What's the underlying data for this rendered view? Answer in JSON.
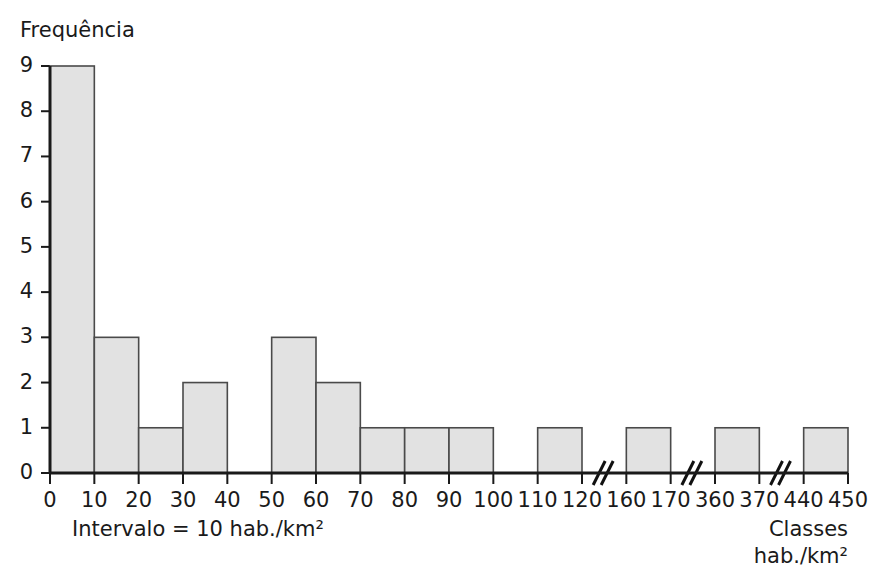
{
  "chart_data": {
    "type": "bar",
    "title": "",
    "ylabel": "Frequência",
    "xlabel": "Classes",
    "xlabel_line2": "hab./km²",
    "note": "Intervalo = 10 hab./km²",
    "ylim": [
      0,
      9
    ],
    "y_ticks": [
      "0",
      "1",
      "2",
      "3",
      "4",
      "5",
      "6",
      "7",
      "8",
      "9"
    ],
    "x_ticks": [
      "0",
      "10",
      "20",
      "30",
      "40",
      "50",
      "60",
      "70",
      "80",
      "90",
      "100",
      "110",
      "120",
      "160",
      "170",
      "360",
      "370",
      "440",
      "450"
    ],
    "grid": false,
    "legend": "none",
    "axis_breaks": [
      {
        "between": [
          "120",
          "160"
        ],
        "symbol": "//"
      },
      {
        "between": [
          "170",
          "360"
        ],
        "symbol": "//"
      },
      {
        "between": [
          "370",
          "440"
        ],
        "symbol": "//"
      }
    ],
    "bin_labels": [
      "0-10",
      "10-20",
      "20-30",
      "30-40",
      "40-50",
      "50-60",
      "60-70",
      "70-80",
      "80-90",
      "90-100",
      "100-110",
      "110-120",
      "120-160",
      "160-170",
      "170-360",
      "360-370",
      "370-440",
      "440-450"
    ],
    "categories": [
      "0-10",
      "10-20",
      "20-30",
      "30-40",
      "40-50",
      "50-60",
      "60-70",
      "70-80",
      "80-90",
      "90-100",
      "100-110",
      "110-120",
      "120-160",
      "160-170",
      "170-360",
      "360-370",
      "370-440",
      "440-450"
    ],
    "values": [
      9,
      3,
      1,
      2,
      0,
      3,
      2,
      1,
      1,
      1,
      0,
      1,
      0,
      1,
      0,
      1,
      0,
      1
    ],
    "bar_fill": "#e2e2e2",
    "bar_stroke": "#4a4a4a",
    "axis_color": "#1a1a1a"
  }
}
